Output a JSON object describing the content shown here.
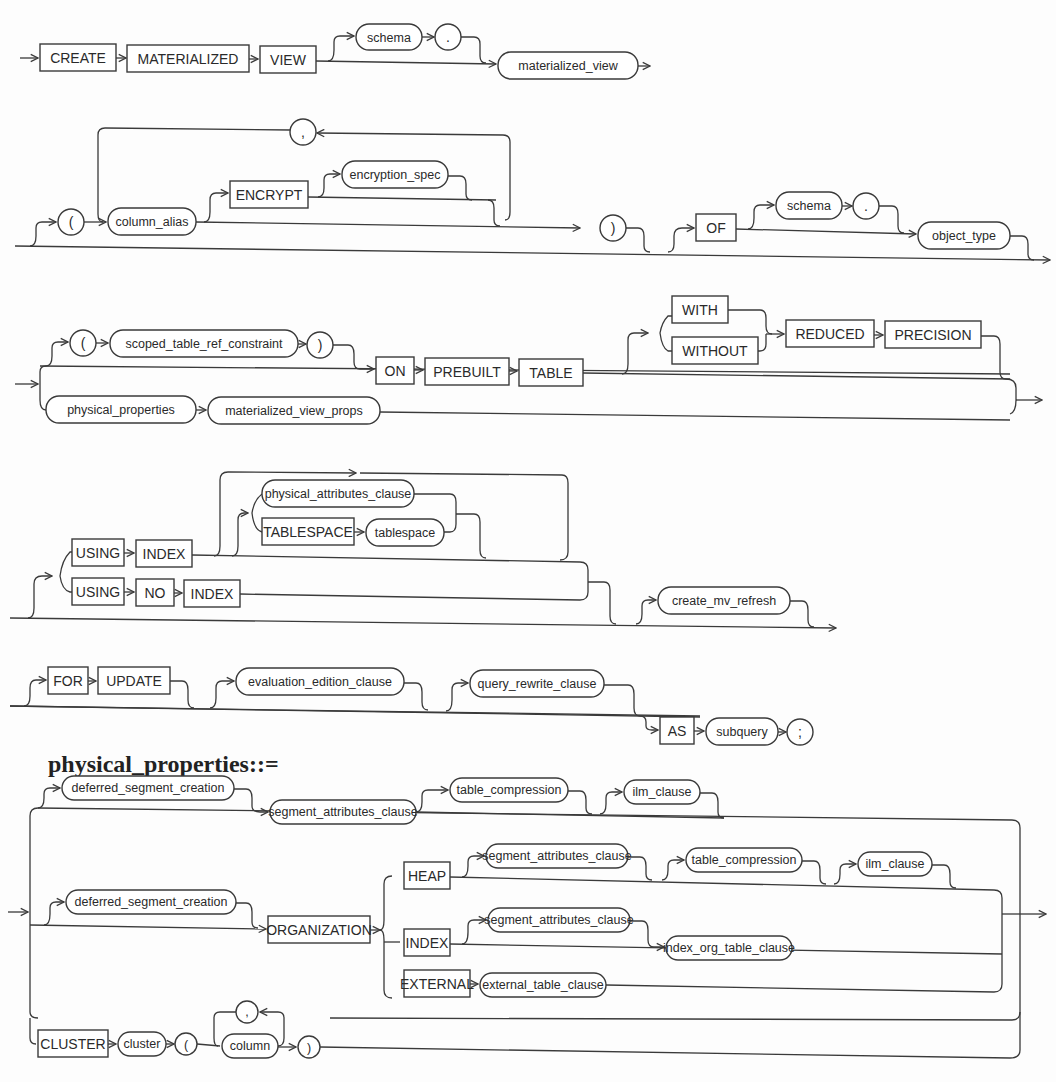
{
  "title": "physical_properties::=",
  "diagrams": {
    "create_mv": {
      "row1": {
        "create": "CREATE",
        "materialized": "MATERIALIZED",
        "view": "VIEW",
        "schema": "schema",
        "dot": ".",
        "materialized_view": "materialized_view"
      },
      "row2": {
        "lparen": "(",
        "column_alias": "column_alias",
        "comma": ",",
        "encrypt": "ENCRYPT",
        "encryption_spec": "encryption_spec",
        "rparen": ")",
        "of": "OF",
        "schema": "schema",
        "dot": ".",
        "object_type": "object_type"
      },
      "row3": {
        "lparen": "(",
        "scoped_table_ref_constraint": "scoped_table_ref_constraint",
        "rparen": ")",
        "on": "ON",
        "prebuilt": "PREBUILT",
        "table": "TABLE",
        "with": "WITH",
        "without": "WITHOUT",
        "reduced": "REDUCED",
        "precision": "PRECISION",
        "physical_properties": "physical_properties",
        "materialized_view_props": "materialized_view_props"
      },
      "row4": {
        "using1": "USING",
        "index1": "INDEX",
        "physical_attributes_clause": "physical_attributes_clause",
        "tablespace_kw": "TABLESPACE",
        "tablespace": "tablespace",
        "using2": "USING",
        "no": "NO",
        "index2": "INDEX",
        "create_mv_refresh": "create_mv_refresh"
      },
      "row5": {
        "for": "FOR",
        "update": "UPDATE",
        "evaluation_edition_clause": "evaluation_edition_clause",
        "query_rewrite_clause": "query_rewrite_clause",
        "as": "AS",
        "subquery": "subquery",
        "semicolon": ";"
      }
    },
    "physical_properties": {
      "deferred_segment_creation_1": "deferred_segment_creation",
      "segment_attributes_clause_1": "segment_attributes_clause",
      "table_compression_1": "table_compression",
      "ilm_clause_1": "ilm_clause",
      "deferred_segment_creation_2": "deferred_segment_creation",
      "organization": "ORGANIZATION",
      "heap": "HEAP",
      "segment_attributes_clause_2": "segment_attributes_clause",
      "table_compression_2": "table_compression",
      "ilm_clause_2": "ilm_clause",
      "index": "INDEX",
      "segment_attributes_clause_3": "segment_attributes_clause",
      "index_org_table_clause": "index_org_table_clause",
      "external": "EXTERNAL",
      "external_table_clause": "external_table_clause",
      "cluster_kw": "CLUSTER",
      "cluster": "cluster",
      "lparen": "(",
      "column": "column",
      "comma": ",",
      "rparen": ")"
    }
  },
  "colors": {
    "line": "#3a3a3a",
    "background": "#fdfdfd"
  }
}
